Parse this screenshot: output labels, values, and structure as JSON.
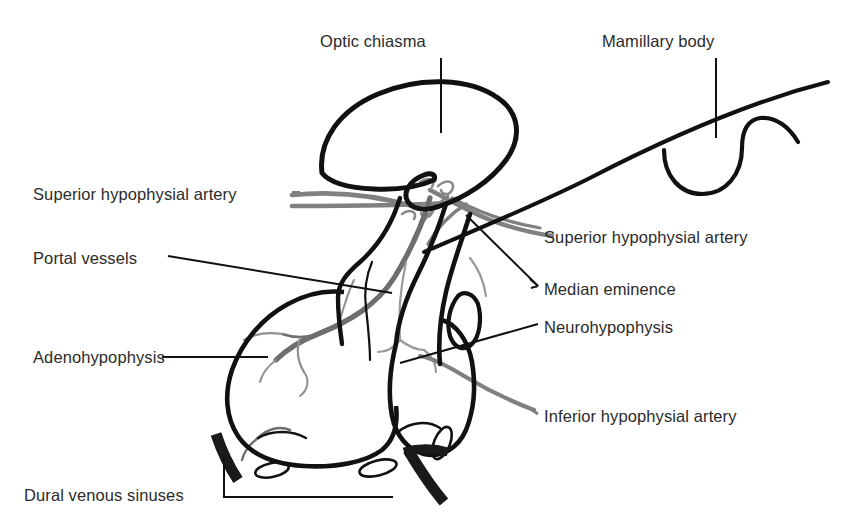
{
  "diagram": {
    "type": "anatomical line diagram",
    "palette": {
      "background": "#ffffff",
      "outline": "#111111",
      "artery_gray": "#808080",
      "portal_vessel_gray": "#6e6e6e",
      "text": "#2b2b2b",
      "leader_line": "#111111",
      "sinus_black": "#1a1a1a"
    },
    "labels": [
      {
        "id": "optic-chiasma",
        "text": "Optic chiasma",
        "side": "top",
        "x": 320,
        "y": 33,
        "leader": "vertical"
      },
      {
        "id": "mamillary-body",
        "text": "Mamillary body",
        "side": "top",
        "x": 602,
        "y": 33,
        "leader": "vertical"
      },
      {
        "id": "superior-hypophysial-artery-left",
        "text": "Superior hypophysial artery",
        "side": "left",
        "x": 33,
        "y": 186,
        "leader": "horizontal-double"
      },
      {
        "id": "portal-vessels",
        "text": "Portal vessels",
        "side": "left",
        "x": 33,
        "y": 250,
        "leader": "diagonal"
      },
      {
        "id": "adenohypophysis",
        "text": "Adenohypophysis",
        "side": "left",
        "x": 33,
        "y": 349,
        "leader": "horizontal"
      },
      {
        "id": "dural-venous-sinuses",
        "text": "Dural venous sinuses",
        "side": "left",
        "x": 24,
        "y": 487,
        "leader": "bracket"
      },
      {
        "id": "superior-hypophysial-artery-right",
        "text": "Superior hypophysial artery",
        "side": "right",
        "x": 544,
        "y": 229,
        "leader": "none"
      },
      {
        "id": "median-eminence",
        "text": "Median eminence",
        "side": "right",
        "x": 544,
        "y": 281,
        "leader": "diagonal"
      },
      {
        "id": "neurohypophysis",
        "text": "Neurohypophysis",
        "side": "right",
        "x": 544,
        "y": 319,
        "leader": "diagonal"
      },
      {
        "id": "inferior-hypophysial-artery",
        "text": "Inferior hypophysial artery",
        "side": "right",
        "x": 544,
        "y": 408,
        "leader": "curve"
      }
    ],
    "structures": [
      "optic chiasma",
      "mamillary body",
      "infundibulum / pituitary stalk",
      "median eminence",
      "adenohypophysis (anterior lobe)",
      "neurohypophysis (posterior lobe)",
      "pars intermedia cleft",
      "superior hypophysial artery",
      "inferior hypophysial artery",
      "hypophysial portal vessels",
      "dural venous sinuses"
    ]
  }
}
